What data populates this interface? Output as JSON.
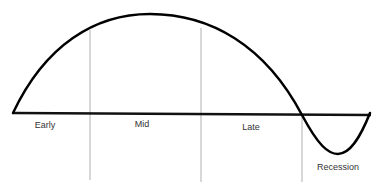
{
  "diagram": {
    "phases": [
      {
        "id": "early",
        "label": "Early"
      },
      {
        "id": "mid",
        "label": "Mid"
      },
      {
        "id": "late",
        "label": "Late"
      },
      {
        "id": "recession",
        "label": "Recession"
      }
    ],
    "colors": {
      "curve": "#000000",
      "baseline": "#111111",
      "divider": "#b0b0b0",
      "text": "#333333"
    }
  }
}
